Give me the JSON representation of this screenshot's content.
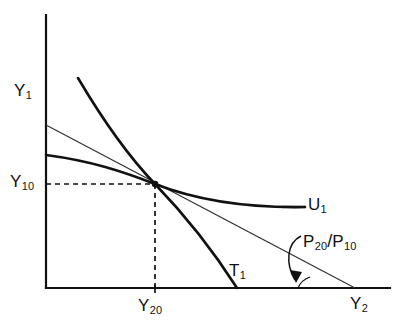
{
  "figure": {
    "name": "consumer-producer-equilibrium-diagram",
    "background": "#ffffff",
    "ink_color": "#111111",
    "width": 405,
    "height": 333
  },
  "axes": {
    "y_axis_label": "Y",
    "y_axis_sub": "1",
    "x_axis_label": "Y",
    "x_axis_sub": "2",
    "origin": {
      "x": 46,
      "y": 288
    },
    "x_axis_end": 390,
    "y_axis_top": 15,
    "stroke_width": 2.2
  },
  "marks": {
    "y10": {
      "base": "Y",
      "sub": "10",
      "value_y": 184
    },
    "y20": {
      "base": "Y",
      "sub": "20",
      "value_x": 155
    },
    "tangency_point": {
      "x": 155,
      "y": 184,
      "radius": 3.2
    },
    "dashed_dash_pattern": "5,4",
    "tick_length": 5
  },
  "curves": {
    "indifference": {
      "label_base": "U",
      "label_sub": "1",
      "path": "M 46 155 C 92 161, 124 172, 155 184 C 196 200, 245 208, 305 207",
      "stroke_width": 2.6,
      "color": "#111111"
    },
    "transformation": {
      "label_base": "T",
      "label_sub": "1",
      "path": "M 78 78 C 104 122, 130 158, 155 184 C 183 213, 214 252, 237 288",
      "stroke_width": 2.6,
      "color": "#111111"
    },
    "price_line": {
      "label_base": "P",
      "label_sub_num": "20",
      "label_slash": "/",
      "label_base2": "P",
      "label_sub_den": "10",
      "start": {
        "x": 46,
        "y": 125
      },
      "end": {
        "x": 355,
        "y": 288
      },
      "stroke_width": 1.3,
      "color": "#333333"
    },
    "u1_leader_line": {
      "x1": 282,
      "y1": 207,
      "x2": 305,
      "y2": 207
    }
  },
  "annotation": {
    "angle_arc_center": {
      "x": 318,
      "y": 288
    },
    "angle_arc_radius": 20,
    "arrow_path": "M 300 238 C 288 244, 287 262, 296 278",
    "arrow_head": "M 296 278 L 291 268 L 301 269 Z",
    "label_text": "P20/P10"
  }
}
